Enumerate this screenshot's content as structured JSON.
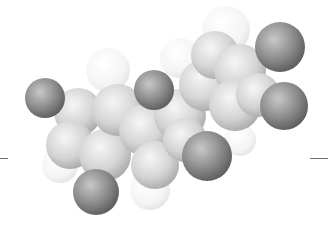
{
  "figure": {
    "background": "#ffffff",
    "colors": {
      "heavy_atom": "#8a8a8a",
      "light_atom": "#f2f2f2",
      "ring_atom": "#d8d8d8",
      "rule": "#6e6e6e"
    },
    "atoms": [
      {
        "kind": "dark",
        "cx": 45,
        "cy": 98,
        "r": 20
      },
      {
        "kind": "dark",
        "cx": 96,
        "cy": 192,
        "r": 23
      },
      {
        "kind": "dark",
        "cx": 154,
        "cy": 90,
        "r": 20
      },
      {
        "kind": "dark",
        "cx": 207,
        "cy": 156,
        "r": 25
      },
      {
        "kind": "dark",
        "cx": 280,
        "cy": 47,
        "r": 25
      },
      {
        "kind": "dark",
        "cx": 284,
        "cy": 106,
        "r": 24
      },
      {
        "kind": "light",
        "cx": 108,
        "cy": 70,
        "r": 22
      },
      {
        "kind": "light",
        "cx": 226,
        "cy": 30,
        "r": 24
      },
      {
        "kind": "light",
        "cx": 180,
        "cy": 58,
        "r": 20
      },
      {
        "kind": "light",
        "cx": 60,
        "cy": 165,
        "r": 18
      },
      {
        "kind": "light",
        "cx": 150,
        "cy": 190,
        "r": 20
      },
      {
        "kind": "light",
        "cx": 240,
        "cy": 140,
        "r": 16
      },
      {
        "kind": "ring",
        "cx": 78,
        "cy": 112,
        "r": 24
      },
      {
        "kind": "ring",
        "cx": 70,
        "cy": 145,
        "r": 24
      },
      {
        "kind": "ring",
        "cx": 105,
        "cy": 155,
        "r": 26
      },
      {
        "kind": "ring",
        "cx": 118,
        "cy": 110,
        "r": 26
      },
      {
        "kind": "ring",
        "cx": 145,
        "cy": 130,
        "r": 26
      },
      {
        "kind": "ring",
        "cx": 155,
        "cy": 165,
        "r": 24
      },
      {
        "kind": "ring",
        "cx": 180,
        "cy": 115,
        "r": 26
      },
      {
        "kind": "ring",
        "cx": 185,
        "cy": 140,
        "r": 22
      },
      {
        "kind": "ring",
        "cx": 205,
        "cy": 85,
        "r": 26
      },
      {
        "kind": "ring",
        "cx": 215,
        "cy": 55,
        "r": 24
      },
      {
        "kind": "ring",
        "cx": 240,
        "cy": 70,
        "r": 26
      },
      {
        "kind": "ring",
        "cx": 235,
        "cy": 105,
        "r": 26
      },
      {
        "kind": "ring",
        "cx": 258,
        "cy": 95,
        "r": 22
      }
    ],
    "rules": [
      {
        "x": 0,
        "width": 8
      },
      {
        "x": 310,
        "width": 18
      }
    ]
  }
}
